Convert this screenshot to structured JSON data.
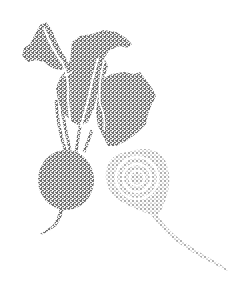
{
  "image": {
    "subject": "Stippled illustration of beets",
    "style": "stipple / dotwork",
    "elements": [
      {
        "name": "whole-beet",
        "description": "Round beet root with leafy greens and stems"
      },
      {
        "name": "halved-beet",
        "description": "Cut beet showing concentric rings and long tapering root"
      }
    ]
  },
  "colors": {
    "ink": "#2b2b2b",
    "ink_light": "#6a6a6a",
    "background": "#ffffff"
  }
}
